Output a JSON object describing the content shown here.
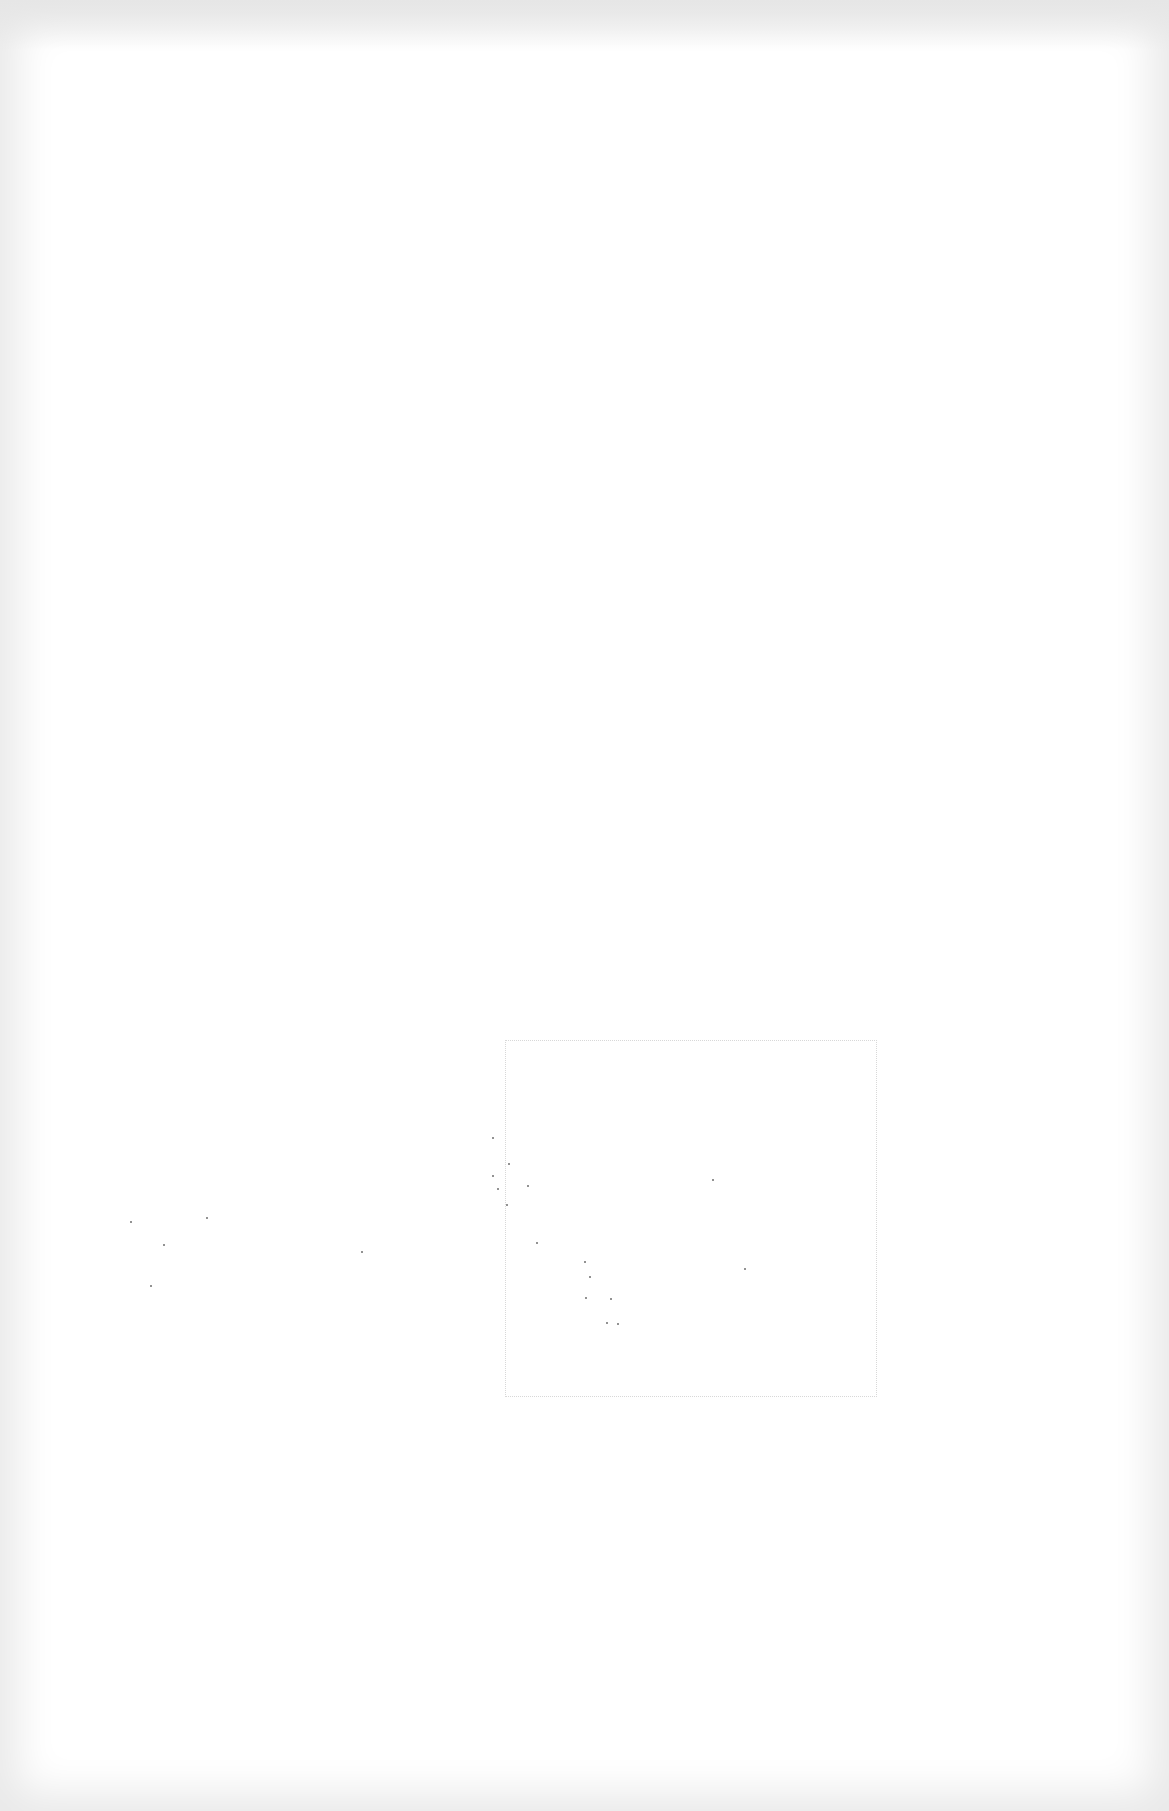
{
  "page": {
    "background": "#ffffff",
    "edge_shade": "#e6e6e6",
    "speck_color": "#6e6e6e"
  },
  "marks": {
    "dotted_box": {
      "x": 505,
      "y": 1040,
      "w": 370,
      "h": 355
    },
    "diagonal_trail": [
      [
        492,
        1137
      ],
      [
        508,
        1163
      ],
      [
        492,
        1175
      ],
      [
        527,
        1185
      ],
      [
        497,
        1188
      ],
      [
        506,
        1204
      ],
      [
        536,
        1242
      ],
      [
        584,
        1261
      ],
      [
        589,
        1276
      ],
      [
        585,
        1297
      ],
      [
        610,
        1298
      ],
      [
        606,
        1322
      ],
      [
        617,
        1323
      ]
    ],
    "left_cluster": [
      [
        130,
        1221
      ],
      [
        163,
        1244
      ],
      [
        206,
        1217
      ],
      [
        150,
        1285
      ],
      [
        361,
        1251
      ]
    ],
    "box_interior": [
      [
        712,
        1179
      ],
      [
        744,
        1268
      ]
    ]
  }
}
